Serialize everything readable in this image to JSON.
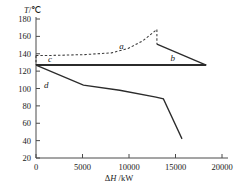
{
  "chart_data": {
    "type": "line",
    "title": "",
    "xlabel": "ΔH /kW",
    "ylabel": "T/℃",
    "xlim": [
      0,
      20000
    ],
    "ylim": [
      20,
      180
    ],
    "xticks": [
      0,
      5000,
      10000,
      15000,
      20000
    ],
    "xtick_labels": [
      "0",
      "5000",
      "10000",
      "15000",
      "20000"
    ],
    "yticks": [
      20,
      40,
      60,
      80,
      100,
      120,
      140,
      160,
      180
    ],
    "ytick_labels": [
      "20",
      "40",
      "60",
      "80",
      "100",
      "120",
      "140",
      "160",
      "180"
    ],
    "grid": false,
    "legend": "inline-curve-labels",
    "series": [
      {
        "name": "a",
        "label": "a",
        "style": "dashed",
        "label_x": 9200,
        "label_y": 146,
        "points": [
          [
            0,
            138
          ],
          [
            1400,
            138
          ],
          [
            5200,
            139
          ],
          [
            8100,
            141
          ],
          [
            9900,
            146
          ],
          [
            11500,
            155
          ],
          [
            13000,
            168
          ],
          [
            13000,
            151
          ]
        ]
      },
      {
        "name": "c",
        "label": "c",
        "style": "dashed-start-marker",
        "label_x": 1500,
        "label_y": 131,
        "points": [
          [
            0,
            138
          ],
          [
            0,
            127
          ]
        ]
      },
      {
        "name": "b",
        "label": "b",
        "style": "solid",
        "label_x": 14700,
        "label_y": 132,
        "points": [
          [
            13000,
            151
          ],
          [
            18300,
            127
          ]
        ]
      },
      {
        "name": "flat",
        "label": "",
        "style": "solid-thick",
        "points": [
          [
            0,
            127
          ],
          [
            18300,
            127
          ]
        ]
      },
      {
        "name": "d",
        "label": "d",
        "style": "solid",
        "label_x": 1100,
        "label_y": 101,
        "points": [
          [
            0,
            127
          ],
          [
            5100,
            104
          ],
          [
            9000,
            98
          ],
          [
            12900,
            90
          ],
          [
            13700,
            88
          ],
          [
            15700,
            42
          ]
        ]
      }
    ]
  },
  "axes": {
    "y_axis_title": "T/℃",
    "x_axis_title": "ΔH /kW",
    "x_axis_title_delta": "Δ",
    "x_axis_title_h": "H",
    "x_axis_title_unit": "/kW"
  },
  "colors": {
    "axis": "#4a4a4a",
    "curve_solid": "#2b2b2b",
    "curve_dashed": "#3a3a3a",
    "background": "#ffffff",
    "text": "#1a1a1a"
  }
}
